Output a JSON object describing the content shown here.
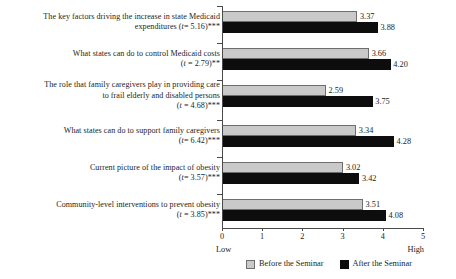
{
  "chart_data": {
    "type": "bar",
    "orientation": "horizontal",
    "title": "",
    "xlabel": "",
    "ylabel": "",
    "xlim": [
      0,
      5
    ],
    "xticks": [
      "0",
      "1",
      "2",
      "3",
      "4",
      "5"
    ],
    "grid": false,
    "legend_position": "bottom",
    "axis_low_label": "Low",
    "axis_high_label": "High",
    "categories": [
      {
        "lines": [
          "The key factors driving the increase in state Medicaid",
          "expenditures (t= 5.16)***"
        ],
        "stat_line": "expenditures (t= 5.16)***",
        "t_value": "5.16",
        "significance": "***"
      },
      {
        "lines": [
          "What states can do to control Medicaid costs",
          "(t = 2.79)**"
        ],
        "stat_line": "(t = 2.79)**",
        "t_value": "2.79",
        "significance": "**"
      },
      {
        "lines": [
          "The role that family caregivers play in providing care",
          "to frail elderly and disabled persons",
          "(t = 4.68)***"
        ],
        "stat_line": "(t = 4.68)***",
        "t_value": "4.68",
        "significance": "***"
      },
      {
        "lines": [
          "What states can do to support family caregivers",
          "(t= 6.42)***"
        ],
        "stat_line": "(t= 6.42)***",
        "t_value": "6.42",
        "significance": "***"
      },
      {
        "lines": [
          "Current picture of the impact of obesity",
          "(t= 3.57)***"
        ],
        "stat_line": "(t= 3.57)***",
        "t_value": "3.57",
        "significance": "***"
      },
      {
        "lines": [
          "Community-level interventions to prevent obesity",
          "(t = 3.85)***"
        ],
        "stat_line": "(t = 3.85)***",
        "t_value": "3.85",
        "significance": "***"
      }
    ],
    "series": [
      {
        "name": "Before the Seminar",
        "color": "#c9c9c9",
        "values": [
          3.37,
          3.66,
          2.59,
          3.34,
          3.02,
          3.51
        ],
        "labels": [
          "3.37",
          "3.66",
          "2.59",
          "3.34",
          "3.02",
          "3.51"
        ]
      },
      {
        "name": "After the Seminar",
        "color": "#0d0d0d",
        "values": [
          3.88,
          4.2,
          3.75,
          4.28,
          3.42,
          4.08
        ],
        "labels": [
          "3.88",
          "4.20",
          "3.75",
          "4.28",
          "3.42",
          "4.08"
        ]
      }
    ]
  },
  "legend": {
    "items": [
      {
        "label": "Before the Seminar"
      },
      {
        "label": "After the Seminar"
      }
    ]
  }
}
